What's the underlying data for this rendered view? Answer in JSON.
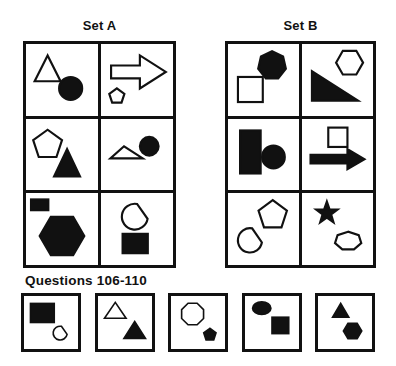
{
  "colors": {
    "ink": "#111111",
    "paper": "#ffffff"
  },
  "set_a": {
    "label": "Set A",
    "cells": [
      {
        "shapes": [
          {
            "name": "triangle-outline-shape",
            "el": "polygon",
            "points": "30,16 12,52 48,52",
            "filled": false
          },
          {
            "name": "circle-solid-shape",
            "el": "circle",
            "cx": 62,
            "cy": 62,
            "r": 16,
            "filled": true
          }
        ]
      },
      {
        "shapes": [
          {
            "name": "arrow-right-outline-shape",
            "el": "polygon",
            "points": "14,30 54,30 54,16 90,39 54,62 54,48 14,48",
            "filled": false
          },
          {
            "name": "pentagon-outline-small-shape",
            "el": "polygon",
            "points": "22,62 11.5,69.6 15.5,81.9 28.5,81.9 32.5,69.6",
            "filled": false
          }
        ]
      },
      {
        "shapes": [
          {
            "name": "pentagon-outline-shape",
            "el": "polygon",
            "points": "30,15 10,29.5 17.7,53 42.3,53 50,29.5",
            "filled": false
          },
          {
            "name": "triangle-solid-shape",
            "el": "polygon",
            "points": "57,42 39,80 75,80",
            "filled": true
          }
        ]
      },
      {
        "shapes": [
          {
            "name": "flat-triangle-outline-shape",
            "el": "polygon",
            "points": "32,38 13,55 58,55",
            "filled": false
          },
          {
            "name": "circle-solid-shape",
            "el": "circle",
            "cx": 67,
            "cy": 38,
            "r": 13,
            "filled": true
          }
        ]
      },
      {
        "shapes": [
          {
            "name": "rect-solid-small-shape",
            "el": "rect",
            "x": 7,
            "y": 9,
            "width": 24,
            "height": 15,
            "filled": true
          },
          {
            "name": "hexagon-solid-shape",
            "el": "polygon",
            "points": "81,60 65.5,33.2 34.5,33.2 19,60 34.5,86.8 65.5,86.8",
            "filled": true
          }
        ]
      },
      {
        "shapes": [
          {
            "name": "blob-outline-shape",
            "el": "path",
            "d": "M 50.1,15.3 A 18,18 0 1 0 64.7,36.1 Z",
            "filled": false
          },
          {
            "name": "rect-solid-shape",
            "el": "rect",
            "x": 30,
            "y": 57,
            "width": 35,
            "height": 27,
            "filled": true
          }
        ]
      }
    ]
  },
  "set_b": {
    "label": "Set B",
    "cells": [
      {
        "shapes": [
          {
            "name": "heptagon-solid-shape",
            "el": "polygon",
            "points": "62,10 46.4,17.5 42.5,34.5 53.3,48 70.7,48 81.5,34.5 77.6,17.5",
            "filled": true
          },
          {
            "name": "square-outline-shape",
            "el": "rect",
            "x": 14,
            "y": 46,
            "width": 35,
            "height": 35,
            "filled": false
          }
        ]
      },
      {
        "shapes": [
          {
            "name": "hexagon-outline-shape",
            "el": "polygon",
            "points": "86,26 76.5,9.5 57.5,9.5 48,26 57.5,42.5 76.5,42.5",
            "filled": false
          },
          {
            "name": "right-triangle-solid-shape",
            "el": "polygon",
            "points": "14,38 14,79 79,79",
            "filled": true
          }
        ]
      },
      {
        "shapes": [
          {
            "name": "rect-solid-tall-shape",
            "el": "rect",
            "x": 17,
            "y": 16,
            "width": 29,
            "height": 60,
            "filled": true
          },
          {
            "name": "circle-solid-shape",
            "el": "circle",
            "cx": 64,
            "cy": 53,
            "r": 16,
            "filled": true
          }
        ]
      },
      {
        "shapes": [
          {
            "name": "square-outline-shape",
            "el": "rect",
            "x": 37,
            "y": 12,
            "width": 27,
            "height": 27,
            "filled": false
          },
          {
            "name": "arrow-right-solid-shape",
            "el": "polygon",
            "points": "12,50 64,50 64,42 88,56 64,70 64,62 12,62",
            "filled": true
          }
        ]
      },
      {
        "shapes": [
          {
            "name": "blob-outline-shape",
            "el": "path",
            "d": "M 34,49.3 A 17,17 0 1 0 47.7,69 Z",
            "filled": false
          },
          {
            "name": "pentagon-outline-shape",
            "el": "polygon",
            "points": "63,10 43,24.5 50.7,48 75.3,48 83,24.5",
            "filled": false
          }
        ]
      },
      {
        "shapes": [
          {
            "name": "star-solid-shape",
            "el": "polygon",
            "points": "35,12 31.2,22.8 19.8,23.1 28.9,30 25.6,40.9 35,34.4 44.4,40.9 41.1,30 50.2,23.1 38.8,22.8",
            "filled": true
          },
          {
            "name": "heptagon-outline-shape",
            "el": "polygon",
            "points": "65,54 50.1,58.9 46.5,69.9 56.8,78.7 73.2,78.7 83.5,69.9 79.9,58.9",
            "filled": false
          }
        ]
      }
    ]
  },
  "questions": {
    "label": "Questions 106-110",
    "options": [
      {
        "shapes": [
          {
            "name": "rect-solid-shape",
            "el": "rect",
            "x": 12,
            "y": 14,
            "width": 44,
            "height": 36,
            "filled": true
          },
          {
            "name": "teardrop-outline-shape",
            "el": "path",
            "d": "M 69.3,57.2 A 13,13 0 1 0 79.8,72.3 Z",
            "filled": false
          }
        ]
      },
      {
        "shapes": [
          {
            "name": "triangle-outline-shape",
            "el": "polygon",
            "points": "32,12 12,42 52,42",
            "filled": false
          },
          {
            "name": "triangle-solid-shape",
            "el": "polygon",
            "points": "68,48 48,80 88,80",
            "filled": true
          }
        ]
      },
      {
        "shapes": [
          {
            "name": "octagon-outline-shape",
            "el": "polygon",
            "points": "60.3,25.6 48.4,13.7 31.6,13.7 19.7,25.6 19.7,42.4 31.6,54.3 48.4,54.3 60.3,42.4",
            "filled": false
          },
          {
            "name": "pentagon-solid-small-shape",
            "el": "polygon",
            "points": "72,61 60.6,69.3 64.9,82.7 79.1,82.7 83.4,69.3",
            "filled": true
          }
        ]
      },
      {
        "shapes": [
          {
            "name": "ellipse-solid-shape",
            "el": "ellipse",
            "cx": 31,
            "cy": 23,
            "rx": 17,
            "ry": 12,
            "filled": true
          },
          {
            "name": "square-solid-shape",
            "el": "rect",
            "x": 50,
            "y": 40,
            "width": 31,
            "height": 31,
            "filled": true
          }
        ]
      },
      {
        "shapes": [
          {
            "name": "triangle-solid-shape",
            "el": "polygon",
            "points": "42,14 27,40 57,40",
            "filled": true
          },
          {
            "name": "hexagon-solid-shape",
            "el": "polygon",
            "points": "81,66 72.5,51.3 55.5,51.3 47,66 55.5,80.7 72.5,80.7",
            "filled": true
          }
        ]
      }
    ]
  }
}
